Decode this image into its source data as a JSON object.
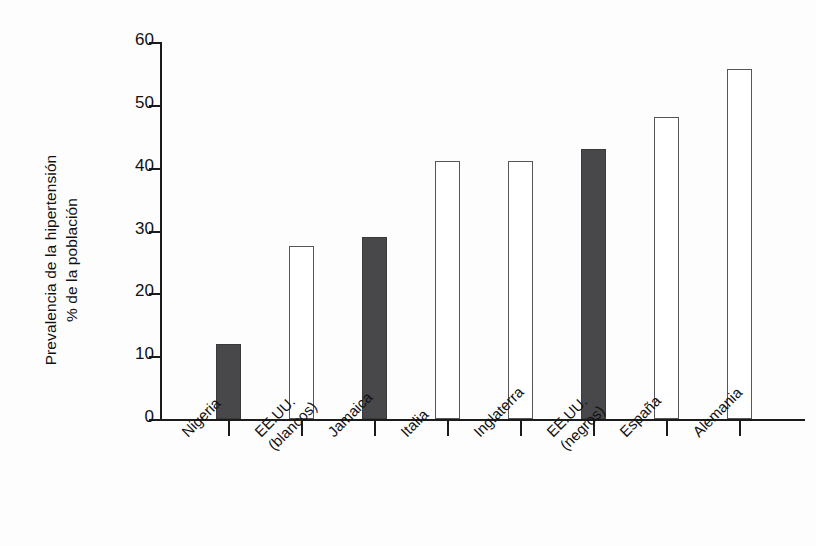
{
  "chart_data": {
    "type": "bar",
    "title": "",
    "xlabel": "",
    "ylabel_lines": [
      "Prevalencia de la hipertensión",
      "% de la población"
    ],
    "ylabel": "Prevalencia de la hipertensión % de la población",
    "categories": [
      "Nigeria",
      "EE.UU. (blancos)",
      "Jamaica",
      "Italia",
      "Inglaterra",
      "EE.UU. (negros)",
      "España",
      "Alemania"
    ],
    "category_lines": [
      [
        "Nigeria"
      ],
      [
        "EE.UU.",
        "(blancos)"
      ],
      [
        "Jamaica"
      ],
      [
        "Italia"
      ],
      [
        "Inglaterra"
      ],
      [
        "EE.UU.",
        "(negros)"
      ],
      [
        "España"
      ],
      [
        "Alemania"
      ]
    ],
    "values": [
      12,
      27.5,
      29,
      41,
      41,
      43,
      48,
      55.7
    ],
    "fill_styles": [
      "filled",
      "hollow",
      "filled",
      "hollow",
      "hollow",
      "filled",
      "hollow",
      "hollow"
    ],
    "ylim": [
      0,
      60
    ],
    "yticks": [
      0,
      10,
      20,
      30,
      40,
      50,
      60
    ],
    "ytick_labels": [
      "0",
      "10",
      "20",
      "30",
      "40",
      "50",
      "60"
    ],
    "grid": false,
    "legend": "none",
    "colors": {
      "filled_bar": "#48484a",
      "hollow_bar_border": "#55555a",
      "hollow_bar_fill": "#ffffff",
      "axis": "#1b1b1b",
      "background": "#fdfdfd",
      "text": "#111111"
    }
  }
}
